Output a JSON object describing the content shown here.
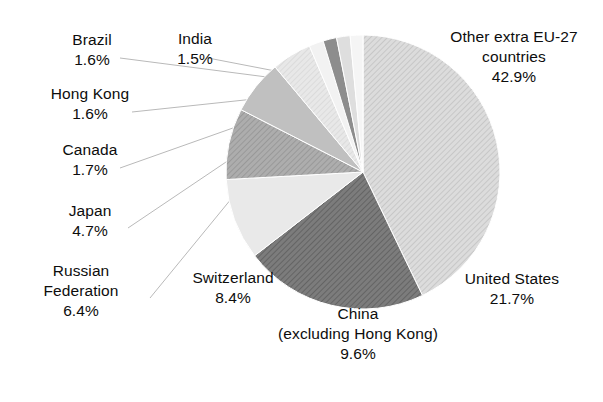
{
  "chart_data": {
    "type": "pie",
    "title": "",
    "subtitle": "",
    "xlabel": "",
    "ylabel": "",
    "legend_position": "none",
    "grid": false,
    "unit": "%",
    "total": 100.1,
    "start_angle_deg": 0,
    "direction": "clockwise",
    "categories": [
      "Other extra EU-27 countries",
      "United States",
      "China (excluding Hong Kong)",
      "Switzerland",
      "Russian Federation",
      "Japan",
      "Canada",
      "Hong Kong",
      "Brazil",
      "India"
    ],
    "values": [
      42.9,
      21.7,
      9.6,
      8.4,
      6.4,
      4.7,
      1.7,
      1.6,
      1.6,
      1.5
    ],
    "slice_colors": [
      "#d2d2d2",
      "#6f6f6f",
      "#e6e6e6",
      "#a2a2a2",
      "#bdbdbd",
      "#e0e0e0",
      "#f1f1f1",
      "#8d8d8d",
      "#dcdcdc",
      "#f4f4f4"
    ]
  },
  "slices": [
    {
      "name": "Other extra EU-27 countries",
      "name_line1": "Other extra EU-27",
      "name_line2": "countries",
      "value": 42.9,
      "percent_label": "42.9%",
      "color": "#d2d2d2",
      "hatched": true
    },
    {
      "name": "United States",
      "name_line1": "United States",
      "name_line2": "",
      "value": 21.7,
      "percent_label": "21.7%",
      "color": "#6f6f6f",
      "hatched": true
    },
    {
      "name": "China (excluding Hong Kong)",
      "name_line1": "China",
      "name_line2": "(excluding Hong Kong)",
      "value": 9.6,
      "percent_label": "9.6%",
      "color": "#e6e6e6",
      "hatched": false
    },
    {
      "name": "Switzerland",
      "name_line1": "Switzerland",
      "name_line2": "",
      "value": 8.4,
      "percent_label": "8.4%",
      "color": "#a2a2a2",
      "hatched": true
    },
    {
      "name": "Russian Federation",
      "name_line1": "Russian",
      "name_line2": "Federation",
      "value": 6.4,
      "percent_label": "6.4%",
      "color": "#bdbdbd",
      "hatched": false
    },
    {
      "name": "Japan",
      "name_line1": "Japan",
      "name_line2": "",
      "value": 4.7,
      "percent_label": "4.7%",
      "color": "#e0e0e0",
      "hatched": true
    },
    {
      "name": "Canada",
      "name_line1": "Canada",
      "name_line2": "",
      "value": 1.7,
      "percent_label": "1.7%",
      "color": "#f1f1f1",
      "hatched": false
    },
    {
      "name": "Hong Kong",
      "name_line1": "Hong Kong",
      "name_line2": "",
      "value": 1.6,
      "percent_label": "1.6%",
      "color": "#8d8d8d",
      "hatched": false
    },
    {
      "name": "Brazil",
      "name_line1": "Brazil",
      "name_line2": "",
      "value": 1.6,
      "percent_label": "1.6%",
      "color": "#dcdcdc",
      "hatched": false
    },
    {
      "name": "India",
      "name_line1": "India",
      "name_line2": "",
      "value": 1.5,
      "percent_label": "1.5%",
      "color": "#f4f4f4",
      "hatched": false
    }
  ]
}
